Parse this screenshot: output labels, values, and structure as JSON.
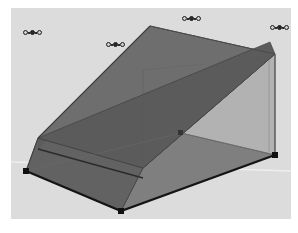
{
  "app": {
    "view_name": "3d-model-viewport",
    "background_color": "#dcdcdc",
    "frame_color": "#ffffff"
  },
  "viewport": {
    "width": 280,
    "height": 211,
    "horizon_line_color": "#efefef"
  },
  "model": {
    "name": "gabled-house-volume",
    "description": "Gable-roofed rectangular building shell in axonometric view",
    "faces": [
      {
        "name": "roof-front-slope",
        "color": "#6e6e6e",
        "opacity": 1,
        "points": "139,18 27,130 128,151 260,34"
      },
      {
        "name": "roof-eave-band",
        "color": "#595959",
        "opacity": 1,
        "points": "128,151 260,34 264,46 132,160"
      },
      {
        "name": "gable-end-left",
        "color": "#646464",
        "opacity": 1,
        "points": "139,18 27,130 27,163 139,66"
      },
      {
        "name": "wall-right-transparent",
        "color": "#707070",
        "opacity": 0.45,
        "points": "132,160 264,46 264,142 132,175"
      },
      {
        "name": "floor-slab",
        "color": "#767676",
        "opacity": 1,
        "points": "15,164 132,175 264,142 118,126"
      },
      {
        "name": "floor-front-left",
        "color": "#6b6b6b",
        "opacity": 1,
        "points": "15,164 132,175 132,207 15,164"
      }
    ],
    "edges": [
      {
        "name": "ridge-line",
        "color": "#3a3a3a"
      },
      {
        "name": "eave-line",
        "color": "#222222"
      },
      {
        "name": "base-outline",
        "color": "#141414"
      },
      {
        "name": "vertical-corner-edge",
        "color": "#4a4a4a"
      }
    ],
    "vertices": [
      {
        "name": "vertex-floor-left",
        "x": 15,
        "y": 163
      },
      {
        "name": "vertex-floor-front",
        "x": 110,
        "y": 203
      },
      {
        "name": "vertex-floor-right",
        "x": 264,
        "y": 147
      },
      {
        "name": "vertex-floor-back",
        "x": 170,
        "y": 125
      }
    ]
  },
  "markers": [
    {
      "name": "snap-marker-top-left",
      "x": 12,
      "y": 22,
      "rings": 3,
      "filled_index": 1
    },
    {
      "name": "snap-marker-top-center",
      "x": 171,
      "y": 8,
      "rings": 3,
      "filled_index": 1
    },
    {
      "name": "snap-marker-top-right",
      "x": 259,
      "y": 17,
      "rings": 3,
      "filled_index": 1
    },
    {
      "name": "snap-marker-ridge",
      "x": 95,
      "y": 34,
      "rings": 3,
      "filled_index": 1
    }
  ]
}
